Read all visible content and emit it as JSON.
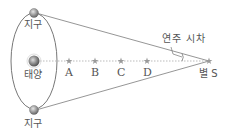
{
  "labels": {
    "earth_top": "지구",
    "sun": "태양",
    "earth_bottom": "지구",
    "parallax": "연주 시차",
    "star_s": "별 S",
    "stars": [
      "A",
      "B",
      "C",
      "D"
    ]
  },
  "colors": {
    "line": "#8a8a8a",
    "orbit": "#777777",
    "star": "#9a9a9a",
    "sun": "#888888",
    "text": "#555555"
  }
}
